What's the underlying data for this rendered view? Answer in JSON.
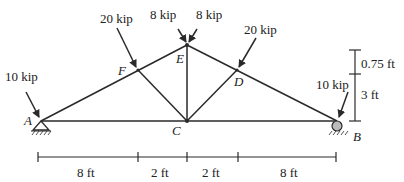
{
  "diagram": {
    "type": "truss",
    "nodes": {
      "A": {
        "label": "A",
        "support": "pin"
      },
      "B": {
        "label": "B",
        "support": "roller"
      },
      "C": {
        "label": "C"
      },
      "D": {
        "label": "D"
      },
      "E": {
        "label": "E"
      },
      "F": {
        "label": "F"
      }
    },
    "members": [
      [
        "A",
        "F"
      ],
      [
        "F",
        "E"
      ],
      [
        "E",
        "D"
      ],
      [
        "D",
        "B"
      ],
      [
        "A",
        "C"
      ],
      [
        "C",
        "B"
      ],
      [
        "F",
        "C"
      ],
      [
        "E",
        "C"
      ],
      [
        "D",
        "C"
      ]
    ],
    "loads": [
      {
        "node": "A",
        "label": "10 kip"
      },
      {
        "node": "F",
        "label": "20 kip"
      },
      {
        "node": "E",
        "label": "8 kip",
        "side": "left"
      },
      {
        "node": "E",
        "label": "8 kip",
        "side": "right"
      },
      {
        "node": "D",
        "label": "20 kip"
      },
      {
        "node": "B",
        "label": "10 kip"
      }
    ],
    "horizontal_dimensions": [
      "8 ft",
      "2 ft",
      "2 ft",
      "8 ft"
    ],
    "vertical_dimensions": [
      "0.75 ft",
      "3 ft"
    ]
  }
}
